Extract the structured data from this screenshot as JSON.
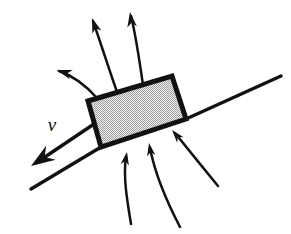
{
  "figure": {
    "background_color": "#ffffff",
    "stroke_color": "#111111",
    "plate_fill_color": "#eeeeee",
    "plate_dot_color": "#9a9a9a",
    "width": 291,
    "height": 234
  },
  "labels": {
    "velocity": "v"
  },
  "plate": {
    "name": "inclined-plate",
    "corners": [
      {
        "x": 88,
        "y": 101
      },
      {
        "x": 172,
        "y": 76
      },
      {
        "x": 186,
        "y": 119
      },
      {
        "x": 101,
        "y": 147
      }
    ],
    "stroke_width": 5,
    "fill_pattern": "stipple-dots"
  },
  "axis_lines": [
    {
      "name": "chord-axis-upper",
      "x1": 186,
      "y1": 119,
      "x2": 281,
      "y2": 76
    },
    {
      "name": "chord-axis-lower",
      "x1": 31,
      "y1": 189,
      "x2": 101,
      "y2": 147
    }
  ],
  "velocity_arrow": {
    "name": "velocity-vector",
    "path": "M 94 124 L 36 163",
    "head": {
      "x": 31,
      "y": 166
    },
    "label_x": 52,
    "label_y": 131
  },
  "outflow_arrows": [
    {
      "name": "outflow-arrow-left",
      "path": "M 97 98 C 88 88, 74 76, 59 71",
      "head_x": 57,
      "head_y": 70,
      "head_angle": -162
    },
    {
      "name": "outflow-arrow-middle-left",
      "path": "M 117 92 C 110 72, 101 44, 93 21",
      "head_x": 92,
      "head_y": 18,
      "head_angle": -109
    },
    {
      "name": "outflow-arrow-middle-right",
      "path": "M 143 85 C 140 64, 136 36, 131 16",
      "head_x": 130,
      "head_y": 12,
      "head_angle": -98
    }
  ],
  "inflow_arrows": [
    {
      "name": "inflow-arrow-left",
      "path": "M 131 224 C 127 200, 123 176, 126 157",
      "head_x": 127,
      "head_y": 152,
      "head_angle": -80
    },
    {
      "name": "inflow-arrow-middle",
      "path": "M 180 227 C 168 204, 155 174, 150 148",
      "head_x": 149,
      "head_y": 143,
      "head_angle": -100
    },
    {
      "name": "inflow-arrow-right",
      "path": "M 218 186 C 204 169, 188 149, 175 133",
      "head_x": 172,
      "head_y": 130,
      "head_angle": -130
    }
  ]
}
